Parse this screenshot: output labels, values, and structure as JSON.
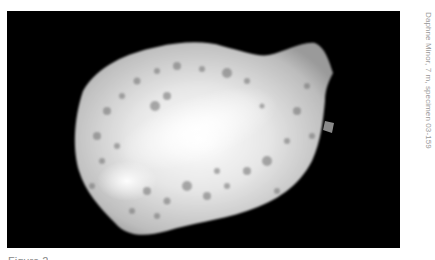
{
  "figure": {
    "side_caption": "Daphne Minor, 7 m, specimen 03-159",
    "label": "Figure 2",
    "background_color": "#000000"
  }
}
